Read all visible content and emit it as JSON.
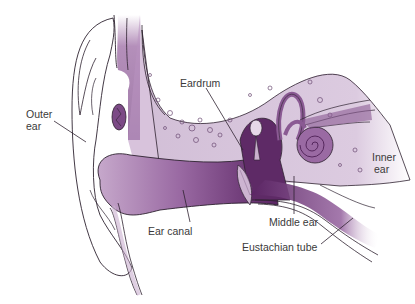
{
  "diagram": {
    "colors": {
      "background": "#ffffff",
      "outline": "#2e2230",
      "bone_light": "#d9c6dd",
      "tissue_mid": "#a77fae",
      "tissue_dark": "#5e2a66",
      "canal_deep": "#6a2f74",
      "label_text": "#3a3a3a"
    },
    "labels": [
      {
        "id": "outer-ear",
        "text_lines": [
          "Outer",
          "ear"
        ]
      },
      {
        "id": "eardrum",
        "text_lines": [
          "Eardrum"
        ]
      },
      {
        "id": "inner-ear",
        "text_lines": [
          "Inner",
          "ear"
        ]
      },
      {
        "id": "middle-ear",
        "text_lines": [
          "Middle ear"
        ]
      },
      {
        "id": "ear-canal",
        "text_lines": [
          "Ear canal"
        ]
      },
      {
        "id": "eustachian-tube",
        "text_lines": [
          "Eustachian tube"
        ]
      }
    ]
  }
}
